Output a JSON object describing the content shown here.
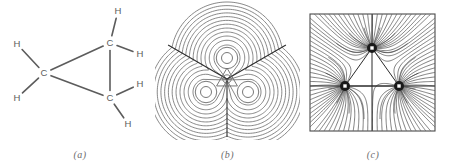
{
  "figure": {
    "background_color": "#ffffff",
    "line_color": "#5c5c5c",
    "dark_line_color": "#3a3a3a",
    "nucleus_color": "#1a1a1a"
  },
  "panels": [
    {
      "id": "a",
      "caption": "(a)",
      "kind": "structural-formula",
      "molecule": "cyclopropane",
      "atoms": [
        {
          "element": "C",
          "id": "C-left",
          "x": 44,
          "y": 73
        },
        {
          "element": "C",
          "id": "C-top",
          "x": 110,
          "y": 43
        },
        {
          "element": "C",
          "id": "C-bottom",
          "x": 110,
          "y": 98
        },
        {
          "element": "H",
          "id": "H-left-upper",
          "x": 17,
          "y": 44
        },
        {
          "element": "H",
          "id": "H-left-lower",
          "x": 17,
          "y": 98
        },
        {
          "element": "H",
          "id": "H-top-above",
          "x": 118,
          "y": 11
        },
        {
          "element": "H",
          "id": "H-top-right",
          "x": 140,
          "y": 54
        },
        {
          "element": "H",
          "id": "H-bottom-right",
          "x": 140,
          "y": 84
        },
        {
          "element": "H",
          "id": "H-bottom-below",
          "x": 128,
          "y": 124
        }
      ],
      "bonds": [
        {
          "from": "C-left",
          "to": "C-top",
          "type": "C-C"
        },
        {
          "from": "C-left",
          "to": "C-bottom",
          "type": "C-C"
        },
        {
          "from": "C-top",
          "to": "C-bottom",
          "type": "C-C"
        },
        {
          "from": "C-left",
          "to": "H-left-upper",
          "type": "C-H"
        },
        {
          "from": "C-left",
          "to": "H-left-lower",
          "type": "C-H"
        },
        {
          "from": "C-top",
          "to": "H-top-above",
          "type": "C-H"
        },
        {
          "from": "C-top",
          "to": "H-top-right",
          "type": "C-H"
        },
        {
          "from": "C-bottom",
          "to": "H-bottom-right",
          "type": "C-H"
        },
        {
          "from": "C-bottom",
          "to": "H-bottom-below",
          "type": "C-H"
        }
      ]
    },
    {
      "id": "b",
      "caption": "(b)",
      "kind": "contour-map",
      "description": "electron density contour map with interatomic surface traces",
      "contour_count": 12,
      "nuclei": [
        {
          "x": 227,
          "y": 58,
          "r": 5.5
        },
        {
          "x": 206,
          "y": 92,
          "r": 5.5
        },
        {
          "x": 248,
          "y": 92,
          "r": 5.5
        }
      ],
      "critical_point": {
        "x": 227,
        "y": 79
      },
      "surface_lines": [
        {
          "angle_deg": 210,
          "length": 68
        },
        {
          "angle_deg": 330,
          "length": 68
        },
        {
          "angle_deg": 90,
          "length": 58
        }
      ]
    },
    {
      "id": "c",
      "caption": "(c)",
      "kind": "gradient-vector-field",
      "description": "gradient vector field of the electron density with bond paths and interatomic surfaces",
      "frame": {
        "x": 310,
        "y": 14,
        "width": 125,
        "height": 117
      },
      "nuclei": [
        {
          "x": 372,
          "y": 48,
          "r": 5
        },
        {
          "x": 345,
          "y": 86,
          "r": 5
        },
        {
          "x": 399,
          "y": 86,
          "r": 5
        }
      ],
      "trajectories_per_nucleus": 34,
      "bond_path_triangle": true
    }
  ]
}
